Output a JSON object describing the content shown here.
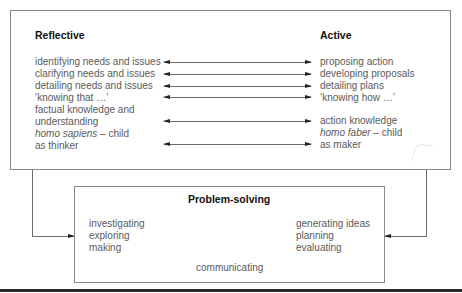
{
  "reflective": {
    "heading": "Reflective",
    "items": [
      "identifying needs and issues",
      "clarifying needs and issues",
      "detailing needs and issues",
      "‘knowing that …’",
      "factual knowledge and",
      "understanding",
      "homo sapiens",
      " – child",
      "as thinker"
    ]
  },
  "active": {
    "heading": "Active",
    "items": [
      "proposing action",
      "developing proposals",
      "detailing plans",
      "‘knowing how …’",
      "action knowledge",
      "homo faber",
      " – child",
      "as maker"
    ]
  },
  "problem_solving": {
    "heading": "Problem-solving",
    "left_items": [
      "investigating",
      "exploring",
      "making"
    ],
    "right_items": [
      "generating ideas",
      "planning",
      "evaluating"
    ],
    "center_item": "communicating"
  },
  "arrows": {
    "type": "bidirectional",
    "count": 6
  }
}
